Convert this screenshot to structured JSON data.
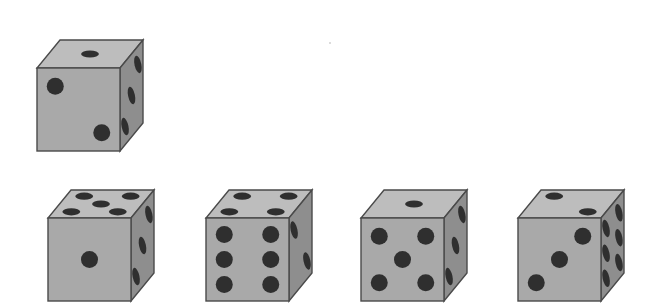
{
  "puzzle": {
    "type": "dice-cube-views",
    "colors": {
      "background": "#ffffff",
      "front_face": "#a9a9a9",
      "top_face": "#bdbdbd",
      "right_face": "#8e8e8e",
      "edge": "#4a4a4a",
      "pip": "#2f2f2f"
    },
    "reference_die": {
      "label": "reference",
      "faces": {
        "top": 1,
        "front": 2,
        "right": 3
      }
    },
    "options": [
      {
        "label": "option-1",
        "faces": {
          "top": 5,
          "front": 1,
          "right": 3
        }
      },
      {
        "label": "option-2",
        "faces": {
          "top": 4,
          "front": 6,
          "right": 2
        }
      },
      {
        "label": "option-3",
        "faces": {
          "top": 1,
          "front": 5,
          "right": 3
        }
      },
      {
        "label": "option-4",
        "faces": {
          "top": 2,
          "front": 3,
          "right": 6
        }
      }
    ]
  }
}
